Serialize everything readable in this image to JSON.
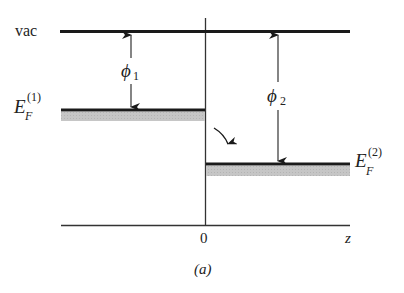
{
  "figure": {
    "caption": "(a)",
    "colors": {
      "line": "#1a1a1a",
      "band": "#c8c8c8",
      "text": "#222222"
    },
    "levels": {
      "vacuum": {
        "label": "vac"
      },
      "fermi_1": {
        "label_main": "E",
        "label_sub": "F",
        "label_sup": "(1)"
      },
      "fermi_2": {
        "label_main": "E",
        "label_sub": "F",
        "label_sup": "(2)"
      }
    },
    "work_functions": {
      "phi1": {
        "symbol": "ϕ",
        "subscript": "1"
      },
      "phi2": {
        "symbol": "ϕ",
        "subscript": "2"
      }
    },
    "axis": {
      "origin_label": "0",
      "variable_label": "z"
    }
  }
}
